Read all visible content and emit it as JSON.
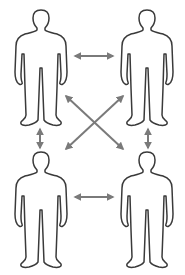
{
  "diagram": {
    "title": "",
    "colors": {
      "background": "#ffffff",
      "figure_stroke": "#3a3a3a",
      "figure_fill": "#ffffff",
      "arrow": "#7a7a7a"
    },
    "nodes": [
      {
        "id": "person-top-left",
        "icon": "person-icon",
        "x": 41,
        "y": 10
      },
      {
        "id": "person-top-right",
        "icon": "person-icon",
        "x": 147,
        "y": 10
      },
      {
        "id": "person-bottom-left",
        "icon": "person-icon",
        "x": 41,
        "y": 152
      },
      {
        "id": "person-bottom-right",
        "icon": "person-icon",
        "x": 147,
        "y": 152
      }
    ],
    "edges": [
      {
        "from": "person-top-left",
        "to": "person-top-right",
        "type": "bidirectional"
      },
      {
        "from": "person-bottom-left",
        "to": "person-bottom-right",
        "type": "bidirectional"
      },
      {
        "from": "person-top-left",
        "to": "person-bottom-left",
        "type": "bidirectional"
      },
      {
        "from": "person-top-right",
        "to": "person-bottom-right",
        "type": "bidirectional"
      },
      {
        "from": "person-top-left",
        "to": "person-bottom-right",
        "type": "bidirectional"
      },
      {
        "from": "person-top-right",
        "to": "person-bottom-left",
        "type": "bidirectional"
      }
    ]
  }
}
